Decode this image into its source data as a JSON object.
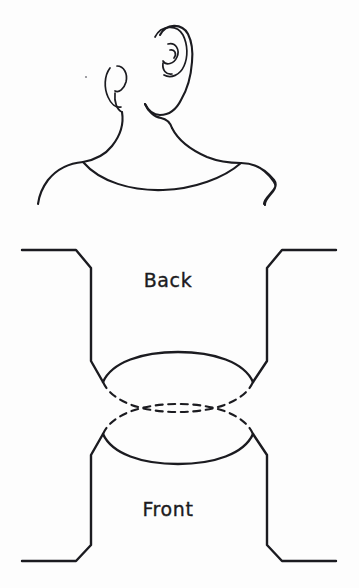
{
  "document": {
    "type": "hand-drawn sewing pattern illustration",
    "title": "Crossover neckline pattern",
    "background_color": "#fdfdfd",
    "ink_color": "#1b1b20"
  },
  "labels": {
    "back": "Back",
    "front": "Front"
  },
  "figure": {
    "upper_illustration_name": "head-neck-shoulders-rear-view",
    "lower_illustration_name": "garment-pattern-pieces",
    "parts": [
      {
        "name": "head-profile",
        "description": "head seen from behind and slightly right"
      },
      {
        "name": "right-ear",
        "description": "detailed ear with helix and tragus spiral"
      },
      {
        "name": "left-ear",
        "description": "simplified far-side ear outline"
      },
      {
        "name": "neck",
        "description": "neck column joining head to shoulders"
      },
      {
        "name": "shoulders",
        "description": "sloping shoulder line left and right"
      },
      {
        "name": "neckline-opening",
        "description": "boat neck opening curve across upper back"
      },
      {
        "name": "back-piece",
        "description": "rectangular pattern piece with angled shoulder cutaways"
      },
      {
        "name": "front-piece",
        "description": "rectangular pattern piece with angled shoulder cutaways"
      },
      {
        "name": "back-neck-curve",
        "description": "solid lens curve on back piece"
      },
      {
        "name": "front-neck-curve",
        "description": "solid lens curve on front piece"
      },
      {
        "name": "crossover-dashed-curves",
        "description": "dashed curves showing overlap of front and back neck openings"
      }
    ]
  },
  "geometry": {
    "canvas": {
      "width": 359,
      "height": 588
    },
    "back_label_position": {
      "x": 168,
      "y": 287
    },
    "front_label_position": {
      "x": 168,
      "y": 516
    },
    "back_piece_top_y": 250,
    "front_piece_bottom_y": 561,
    "piece_left_x": 22,
    "piece_right_x": 336,
    "crossover_center": {
      "x": 178,
      "y": 408
    }
  }
}
